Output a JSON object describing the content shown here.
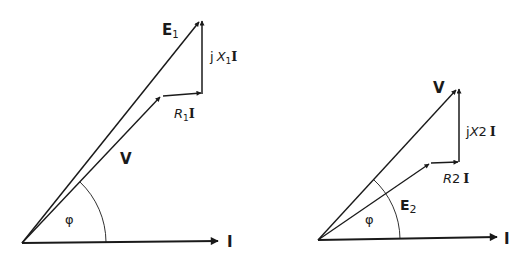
{
  "diagrams": [
    {
      "name": "left-phasor-diagram",
      "labels": {
        "e": "E",
        "e_sub": "1",
        "jx_j": "j",
        "jx_x": "X",
        "jx_sub": "1",
        "jx_i": "I",
        "r": "R",
        "r_sub": "1",
        "r_i": "I",
        "v": "V",
        "phi": "φ",
        "i": "I"
      }
    },
    {
      "name": "right-phasor-diagram",
      "labels": {
        "v": "V",
        "jx_j": "j",
        "jx_x": "X",
        "jx_sub": "2",
        "jx_i": "I",
        "r": "R",
        "r_sub": "2",
        "r_i": "I",
        "e": "E",
        "e_sub": "2",
        "phi": "φ",
        "i": "I"
      }
    }
  ],
  "colors": {
    "ink": "#1a1a1a",
    "background": "#ffffff"
  }
}
